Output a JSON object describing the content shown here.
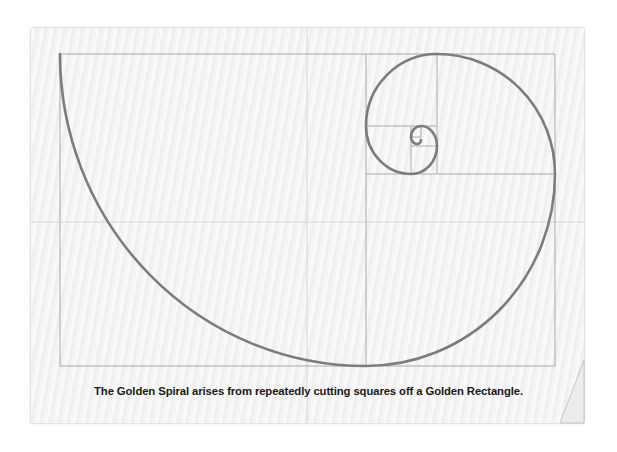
{
  "caption": "The Golden Spiral arises from repeatedly cutting squares off a Golden Rectangle.",
  "colors": {
    "paper": "#f4f4f4",
    "grid_line": "#a3a3a3",
    "spiral": "#7c7c7c",
    "fold": "#d8d8d8",
    "caption_text": "#1a1a1a"
  },
  "diagram": {
    "type": "golden-spiral",
    "outer_rectangle": {
      "x": 60,
      "y": 54,
      "width": 495,
      "height": 312
    },
    "squares": [
      {
        "x": 60,
        "y": 54,
        "size": 306
      },
      {
        "x": 366,
        "y": 174,
        "size": 189
      },
      {
        "x": 437,
        "y": 54,
        "size": 118
      },
      {
        "x": 366,
        "y": 54,
        "size": 71
      },
      {
        "x": 366,
        "y": 126,
        "size": 45
      },
      {
        "x": 411,
        "y": 146,
        "size": 26
      }
    ]
  }
}
